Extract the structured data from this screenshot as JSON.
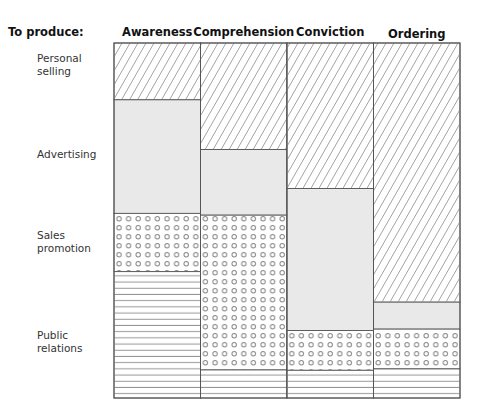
{
  "chart_data": {
    "type": "bar",
    "stacked": true,
    "normalized": true,
    "title": "",
    "row_header": "To produce:",
    "categories": [
      "Awareness",
      "Comprehension",
      "Conviction",
      "Ordering"
    ],
    "series": [
      {
        "name": "Personal selling",
        "label_lines": [
          "Personal",
          "selling"
        ],
        "pattern": "diagonal-hatch",
        "values": [
          16,
          30,
          41,
          73
        ]
      },
      {
        "name": "Advertising",
        "label_lines": [
          "Advertising"
        ],
        "pattern": "gray-fill",
        "values": [
          32,
          18.5,
          40,
          7.6
        ]
      },
      {
        "name": "Sales promotion",
        "label_lines": [
          "Sales",
          "promotion"
        ],
        "pattern": "dots",
        "values": [
          16.4,
          43.6,
          11.2,
          11.2
        ]
      },
      {
        "name": "Public relations",
        "label_lines": [
          "Public",
          "relations"
        ],
        "pattern": "horizontal-lines",
        "values": [
          35.6,
          7.9,
          7.8,
          8.2
        ]
      }
    ],
    "ylim": [
      0,
      100
    ],
    "xlabel": "",
    "ylabel": "",
    "grid": false,
    "legend": "left"
  },
  "colors": {
    "stroke": "#555555",
    "hatch": "#8a8a8a",
    "gray_fill": "#e9e9e9",
    "dot": "#888888"
  }
}
